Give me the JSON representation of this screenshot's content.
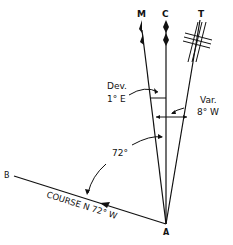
{
  "diagram": {
    "labels": {
      "magnetic": "M",
      "compass": "C",
      "true": "T",
      "point_a": "A",
      "point_b": "B",
      "deviation_title": "Dev.",
      "deviation_value": "1° E",
      "variation_title": "Var.",
      "variation_value": "8° W",
      "angle": "72°",
      "course": "COURSE N 72° W"
    },
    "colors": {
      "ink": "#111111",
      "background": "#ffffff"
    }
  }
}
